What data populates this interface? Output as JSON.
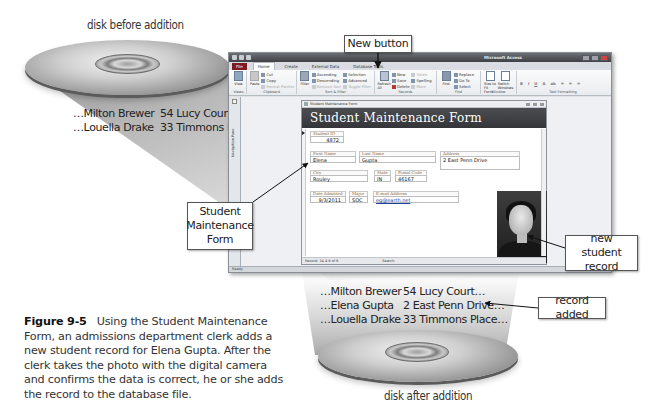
{
  "figure": {
    "number": "Figure 9-5",
    "caption": "Using the Student Maintenance Form, an admissions department clerk adds a new student record for Elena Gupta. After the clerk takes the photo with the digital camera and confirms the data is correct, he or she adds the record to the database file."
  },
  "disk_before": {
    "label": "disk before addition",
    "records": [
      {
        "name": "…Milton Brewer",
        "address": "54 Lucy Court…"
      },
      {
        "name": "…Louella Drake",
        "address": "33 Timmons Place…"
      }
    ]
  },
  "disk_after": {
    "label": "disk after addition",
    "records": [
      {
        "name": "…Milton Brewer",
        "address": "54 Lucy Court…"
      },
      {
        "name": "…Elena Gupta",
        "address": "2 East Penn Drive…"
      },
      {
        "name": "…Louella Drake",
        "address": "33 Timmons Place…"
      }
    ]
  },
  "callouts": {
    "new_button": "New button",
    "student_form": "Student Maintenance Form",
    "new_record": "new student record",
    "record_added": "record added"
  },
  "app": {
    "title": "Microsoft Access",
    "tabs": [
      "File",
      "Home",
      "Create",
      "External Data",
      "Database Tools"
    ],
    "active_tab": "Home",
    "ribbon": {
      "views": {
        "view": "View",
        "group": "Views"
      },
      "clipboard": {
        "paste": "Paste",
        "cut": "Cut",
        "copy": "Copy",
        "format_painter": "Format Painter",
        "group": "Clipboard"
      },
      "sort_filter": {
        "filter": "Filter",
        "ascending": "Ascending",
        "descending": "Descending",
        "remove_sort": "Remove Sort",
        "selection": "Selection",
        "advanced": "Advanced",
        "toggle_filter": "Toggle Filter",
        "group": "Sort & Filter"
      },
      "records": {
        "refresh_all": "Refresh All",
        "new": "New",
        "save": "Save",
        "delete": "Delete",
        "totals": "Totals",
        "spelling": "Spelling",
        "more": "More",
        "group": "Records"
      },
      "find": {
        "find": "Find",
        "replace": "Replace",
        "go_to": "Go To",
        "select": "Select",
        "group": "Find"
      },
      "window": {
        "size_to_fit": "Size to Fit Form",
        "switch_windows": "Switch Windows",
        "group": "Window"
      },
      "text_formatting": {
        "group": "Text Formatting"
      }
    },
    "nav_pane_label": "Navigation Pane",
    "status_text": "Ready",
    "form": {
      "tab_title": "Student Maintenance Form",
      "header": "Student Maintenance Form",
      "fields": {
        "student_id": {
          "label": "Student ID",
          "value": "4872"
        },
        "first_name": {
          "label": "First Name",
          "value": "Elena"
        },
        "last_name": {
          "label": "Last Name",
          "value": "Gupta"
        },
        "address": {
          "label": "Address",
          "value": "2 East Penn Drive"
        },
        "city": {
          "label": "City",
          "value": "Rouley"
        },
        "state": {
          "label": "State",
          "value": "IN"
        },
        "postal_code": {
          "label": "Postal Code",
          "value": "46167"
        },
        "date_admitted": {
          "label": "Date Admitted",
          "value": "9/3/2011"
        },
        "major": {
          "label": "Major",
          "value": "SOC"
        },
        "email": {
          "label": "E-mail Address",
          "value": "eg@earth.net"
        }
      },
      "record_nav": {
        "record_text": "Record: 14 4 9 of 9",
        "search": "Search"
      }
    }
  }
}
